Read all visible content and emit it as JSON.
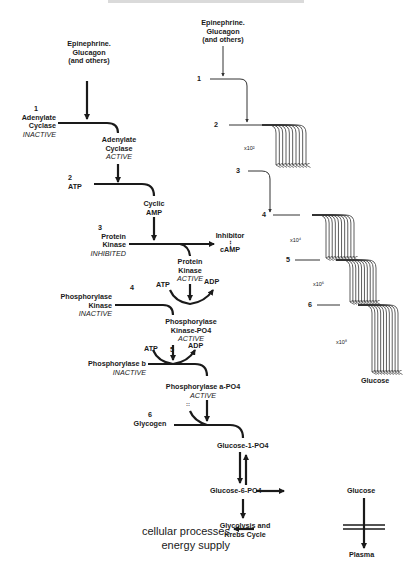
{
  "diagram": {
    "header_clipped": true,
    "left_pathway": {
      "stimulus": [
        "Epinephrine.",
        "Glucagon",
        "(and others)"
      ],
      "steps": [
        {
          "num": "1",
          "inactive": [
            "Adenylate",
            "Cyclase"
          ],
          "inactive_state": "INACTIVE",
          "active": [
            "Adenylate",
            "Cyclase"
          ],
          "active_state": "ACTIVE"
        },
        {
          "num": "2",
          "substrate": "ATP",
          "product": [
            "Cyclic",
            "AMP"
          ]
        },
        {
          "num": "3",
          "inactive": [
            "Protein",
            "Kinase"
          ],
          "inactive_state": "INHIBITED",
          "active": [
            "Protein",
            "Kinase"
          ],
          "active_state": "ACTIVE",
          "side_product": [
            "Inhibitor",
            "cAMP"
          ]
        },
        {
          "num": "4",
          "atp": "ATP",
          "adp": "ADP",
          "inactive": [
            "Phosphorylase",
            "Kinase"
          ],
          "inactive_state": "INACTIVE",
          "active": [
            "Phosphorylase",
            "Kinase-PO4"
          ],
          "active_state": "ACTIVE"
        },
        {
          "num": "5",
          "atp": "ATP",
          "adp": "ADP",
          "inactive": "Phosphorylase b",
          "inactive_state": "INACTIVE",
          "active": "Phosphorylase a-PO4",
          "active_state": "ACTIVE"
        },
        {
          "num": "6",
          "substrate": "Glycogen",
          "product": "Glucose-1-PO4"
        }
      ],
      "downstream": {
        "g6p": "Glucose-6-PO4",
        "glucose": "Glucose",
        "plasma": "Plasma",
        "glycolysis": [
          "Glycolysis and",
          "Krebs  Cycle"
        ],
        "cellular": [
          "cellular processes",
          "energy supply"
        ]
      }
    },
    "right_amplification": {
      "stimulus": [
        "Epinephrine.",
        "Glucagon",
        "(and others)"
      ],
      "levels": [
        {
          "num": "1"
        },
        {
          "num": "2",
          "factor": "x10²"
        },
        {
          "num": "3"
        },
        {
          "num": "4",
          "factor": "x10⁴"
        },
        {
          "num": "5",
          "factor": "x10⁶"
        },
        {
          "num": "6",
          "factor": "x10⁸"
        }
      ],
      "output": "Glucose"
    },
    "colors": {
      "ink": "#1a1a1a",
      "thin_ink": "#333333",
      "background": "#ffffff"
    }
  }
}
